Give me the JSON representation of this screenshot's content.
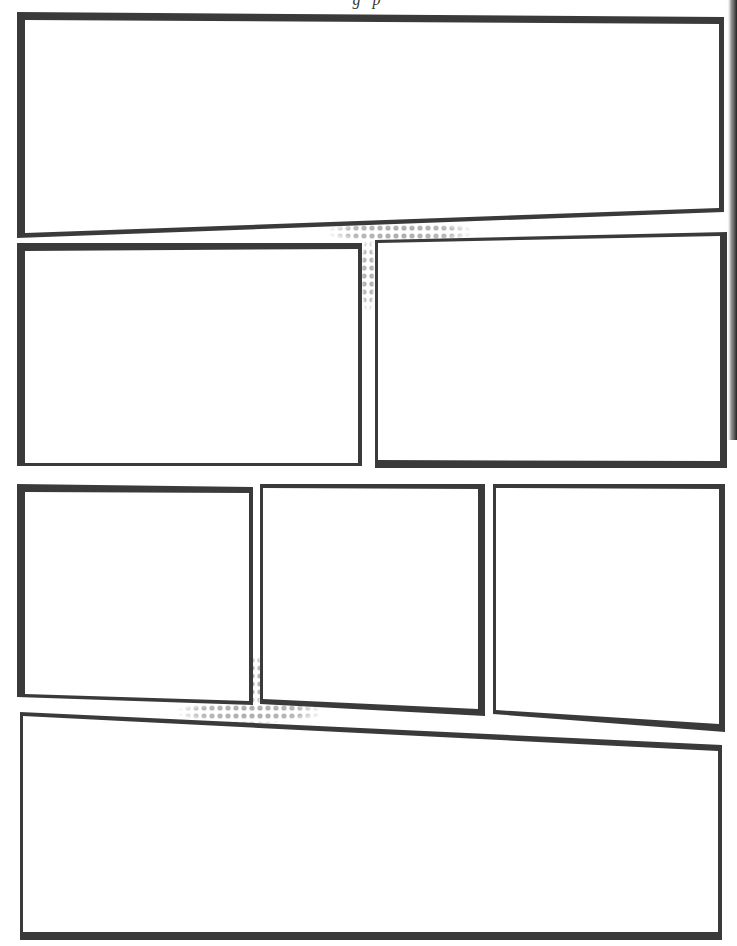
{
  "page": {
    "title_fragment_visible": "g  p",
    "background": "#ffffff",
    "border_color": "#3a3a3a",
    "halftone_color": "#a8a8a8",
    "panel_fill": "#ffffff"
  },
  "panels": [
    {
      "id": 1,
      "label": "panel-1",
      "row": 1,
      "points": "17,12 724,17 724,212 17,238",
      "inner": "25,20 719,24 719,208 25,233"
    },
    {
      "id": 2,
      "label": "panel-2",
      "row": 2,
      "points": "17,243 362,243 362,466 17,466",
      "inner": "25,251 358,249 358,463 25,463"
    },
    {
      "id": 3,
      "label": "panel-3",
      "row": 2,
      "points": "375,240 727,232 727,468 375,468",
      "inner": "378,243 720,236 720,461 378,460"
    },
    {
      "id": 4,
      "label": "panel-4",
      "row": 3,
      "points": "17,484 253,487 253,705 17,697",
      "inner": "25,492 249,493 249,701 25,694"
    },
    {
      "id": 5,
      "label": "panel-5",
      "row": 3,
      "points": "260,484 485,484 485,716 260,704",
      "inner": "263,488 478,489 478,709 263,699"
    },
    {
      "id": 6,
      "label": "panel-6",
      "row": 3,
      "points": "493,484 725,484 725,732 493,714",
      "inner": "496,488 719,489 719,724 496,710"
    },
    {
      "id": 7,
      "label": "panel-7",
      "row": 4,
      "points": "20,712 722,745 722,940 20,940",
      "inner": "23,716 718,751 718,932 23,932"
    }
  ],
  "halftones": [
    {
      "label": "halftone-upper-gutter",
      "cx": 400,
      "cy": 232,
      "rx": 75,
      "ry": 12
    },
    {
      "label": "halftone-upper-vertical",
      "cx": 368,
      "cy": 275,
      "rx": 7,
      "ry": 40
    },
    {
      "label": "halftone-lower-gutter",
      "cx": 250,
      "cy": 712,
      "rx": 75,
      "ry": 12
    },
    {
      "label": "halftone-lower-vertical",
      "cx": 256,
      "cy": 680,
      "rx": 6,
      "ry": 30
    }
  ]
}
